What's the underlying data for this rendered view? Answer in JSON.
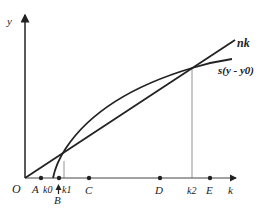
{
  "diagram": {
    "type": "solow-growth-diagram",
    "axes": {
      "y_label": "y",
      "x_label": "k",
      "origin_label": "O"
    },
    "curves": [
      {
        "id": "nk",
        "label": "nk",
        "kind": "straight line through origin"
      },
      {
        "id": "savings",
        "label": "s(y - y0)",
        "kind": "concave curve starting at k0"
      }
    ],
    "points": [
      {
        "label": "A",
        "marker": "dot"
      },
      {
        "label": "k0",
        "marker": "none"
      },
      {
        "label": "k1",
        "marker": "dot"
      },
      {
        "label": "B",
        "marker": "up-arrow"
      },
      {
        "label": "C",
        "marker": "dot"
      },
      {
        "label": "D",
        "marker": "dot"
      },
      {
        "label": "k2",
        "marker": "none"
      },
      {
        "label": "E",
        "marker": "dot"
      }
    ],
    "colors": {
      "line": "#222222",
      "guide": "#555555",
      "background": "#ffffff"
    }
  }
}
